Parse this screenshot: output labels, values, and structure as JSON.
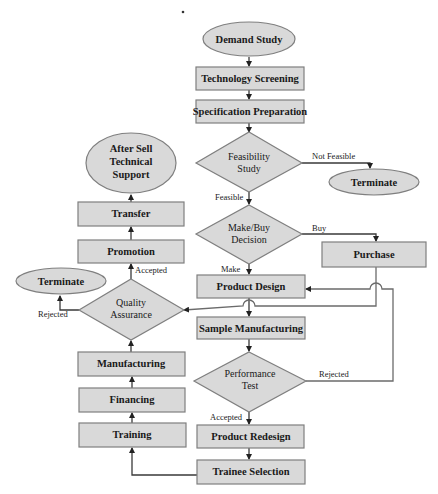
{
  "nodes": {
    "demand_study": "Demand Study",
    "technology_screening": "Technology Screening",
    "specification_preparation": "Specification Preparation",
    "feasibility_study": [
      "Feasibility",
      "Study"
    ],
    "terminate_right": "Terminate",
    "make_buy_decision": [
      "Make/Buy",
      "Decision"
    ],
    "purchase": "Purchase",
    "product_design": "Product Design",
    "sample_manufacturing": "Sample Manufacturing",
    "performance_test": [
      "Performance",
      "Test"
    ],
    "product_redesign": "Product Redesign",
    "trainee_selection": "Trainee Selection",
    "training": "Training",
    "financing": "Financing",
    "manufacturing": "Manufacturing",
    "quality_assurance": [
      "Quality",
      "Assurance"
    ],
    "terminate_left": "Terminate",
    "promotion": "Promotion",
    "transfer": "Transfer",
    "after_sell_support": [
      "After Sell",
      "Technical",
      "Support"
    ]
  },
  "edge_labels": {
    "not_feasible": "Not Feasible",
    "feasible": "Feasible",
    "buy": "Buy",
    "make": "Make",
    "perf_rejected": "Rejected",
    "perf_accepted": "Accepted",
    "qa_rejected": "Rejected",
    "qa_accepted": "Accepted"
  },
  "colors": {
    "node_fill": "#d9d9d9",
    "node_border": "#7f7f7f",
    "edge": "#3a3a3a"
  }
}
